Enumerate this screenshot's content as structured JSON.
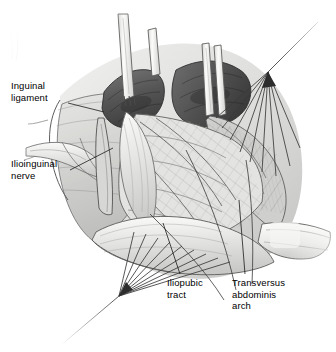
{
  "figure": {
    "type": "medical-illustration",
    "view": "right groin, anterior approach, retracted",
    "background_color": "#ffffff",
    "width": 336,
    "height": 352
  },
  "palette": {
    "background": "#ffffff",
    "ink": "#3c3c3c",
    "ink_dark": "#272727",
    "muscle_dark": "#5c5c5c",
    "muscle_mid": "#8d8d8d",
    "fascia_light": "#e8e8e6",
    "fascia_mid": "#cfcfcd",
    "fascia_shadow": "#b2b2b0",
    "instrument": "#f2f2f0",
    "text": "#000000"
  },
  "labels": [
    {
      "id": "inguinal-ligament",
      "text": "Inguinal\nligament",
      "lines": [
        "Inguinal",
        "ligament"
      ],
      "x": 11,
      "y": 80,
      "leader": {
        "from_x": 68,
        "from_y": 103,
        "to_x": 104,
        "to_y": 112
      }
    },
    {
      "id": "ilioinguinal-nerve",
      "text": "Ilioinguinal\nnerve",
      "lines": [
        "Ilioinguinal",
        "nerve"
      ],
      "x": 11,
      "y": 158,
      "leader": {
        "from_x": 70,
        "from_y": 170,
        "to_x": 113,
        "to_y": 148
      }
    },
    {
      "id": "iliopubic-tract",
      "text": "Iliopubic\ntract",
      "lines": [
        "Iliopubic",
        "tract"
      ],
      "x": 167,
      "y": 277,
      "leader": {
        "from_x": 180,
        "from_y": 274,
        "to_x": 163,
        "to_y": 223
      }
    },
    {
      "id": "transversus-abdominis-arch",
      "text": "Transversus\nabdominis\narch",
      "lines": [
        "Transversus",
        "abdominis",
        "arch"
      ],
      "x": 232,
      "y": 277,
      "leader": {
        "from_x": 245,
        "from_y": 274,
        "to_x": 239,
        "to_y": 200
      }
    }
  ],
  "structures": [
    {
      "id": "external-oblique-aponeurosis",
      "note": "reflected pale sheet, left and upper margins"
    },
    {
      "id": "internal-oblique-muscle",
      "note": "dark muscle bellies across upper field"
    },
    {
      "id": "transversus-abdominis-arch",
      "note": "arching aponeurotic edge, right of field"
    },
    {
      "id": "transversalis-fascia",
      "note": "cross-hatched central sheet"
    },
    {
      "id": "iliopubic-tract",
      "note": "pale curved band crossing lower field"
    },
    {
      "id": "ilioinguinal-nerve",
      "note": "pale cord running obliquely at left"
    },
    {
      "id": "spermatic-cord",
      "note": "pale bundle exiting to right margin"
    },
    {
      "id": "inguinal-ligament",
      "note": "rolled pale edge, lower left"
    }
  ],
  "instruments": [
    {
      "id": "retractor-blade-left",
      "type": "retractor",
      "count": 1
    },
    {
      "id": "retractor-blade-center",
      "type": "retractor",
      "count": 1
    },
    {
      "id": "retractor-blade-right",
      "type": "retractor",
      "count": 1
    },
    {
      "id": "suture-fan-upper-right",
      "type": "traction-sutures",
      "apex_x": 268,
      "apex_y": 72,
      "count": 9
    },
    {
      "id": "suture-fan-lower-left",
      "type": "traction-sutures",
      "apex_x": 119,
      "apex_y": 296,
      "count": 10
    }
  ]
}
